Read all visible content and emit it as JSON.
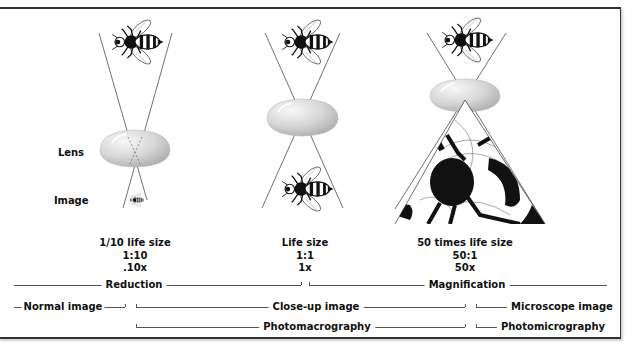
{
  "side_labels": {
    "lens": "Lens",
    "image": "Image"
  },
  "columns": [
    {
      "id": "reduction",
      "title": "1/10 life size",
      "ratio": "1:10",
      "factor": ".10x"
    },
    {
      "id": "life-size",
      "title": "Life size",
      "ratio": "1:1",
      "factor": "1x"
    },
    {
      "id": "magnification",
      "title": "50 times life size",
      "ratio": "50:1",
      "factor": "50x"
    }
  ],
  "ranges": {
    "row1": {
      "left": "Reduction",
      "right": "Magnification"
    },
    "row2": {
      "left": "Normal image",
      "middle": "Close-up image",
      "right": "Microscope image"
    },
    "row3": {
      "middle": "Photomacrography",
      "right": "Photomicrography"
    }
  },
  "colors": {
    "frame": "#333333",
    "lines": "#555555",
    "lens_light": "#f2f2f2",
    "lens_dark": "#b8b8b8",
    "ink": "#111111"
  }
}
